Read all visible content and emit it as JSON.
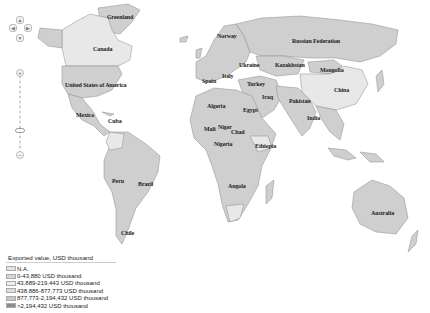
{
  "map": {
    "countries": [
      {
        "name": "Greenland",
        "x": 107,
        "y": 17
      },
      {
        "name": "Canada",
        "x": 95,
        "y": 46
      },
      {
        "name": "United States of America",
        "x": 66,
        "y": 83
      },
      {
        "name": "Mexico",
        "x": 76,
        "y": 115
      },
      {
        "name": "Cuba",
        "x": 108,
        "y": 118
      },
      {
        "name": "Peru",
        "x": 112,
        "y": 180
      },
      {
        "name": "Brazil",
        "x": 138,
        "y": 182
      },
      {
        "name": "Chile",
        "x": 121,
        "y": 230
      },
      {
        "name": "Norway",
        "x": 218,
        "y": 35
      },
      {
        "name": "Russian Federation",
        "x": 292,
        "y": 40
      },
      {
        "name": "Ukraine",
        "x": 239,
        "y": 62
      },
      {
        "name": "Kazakhstan",
        "x": 275,
        "y": 63
      },
      {
        "name": "Mongolia",
        "x": 320,
        "y": 68
      },
      {
        "name": "Italy",
        "x": 222,
        "y": 73
      },
      {
        "name": "Spain",
        "x": 202,
        "y": 79
      },
      {
        "name": "Turkey",
        "x": 247,
        "y": 82
      },
      {
        "name": "Iraq",
        "x": 262,
        "y": 96
      },
      {
        "name": "China",
        "x": 335,
        "y": 87
      },
      {
        "name": "Pakistan",
        "x": 290,
        "y": 99
      },
      {
        "name": "Algeria",
        "x": 208,
        "y": 105
      },
      {
        "name": "Egypt",
        "x": 243,
        "y": 108
      },
      {
        "name": "India",
        "x": 308,
        "y": 116
      },
      {
        "name": "Mali",
        "x": 204,
        "y": 126
      },
      {
        "name": "Niger",
        "x": 219,
        "y": 125
      },
      {
        "name": "Chad",
        "x": 231,
        "y": 129
      },
      {
        "name": "Nigeria",
        "x": 215,
        "y": 140
      },
      {
        "name": "Ethiopia",
        "x": 256,
        "y": 143
      },
      {
        "name": "Angola",
        "x": 228,
        "y": 184
      },
      {
        "name": "Australia",
        "x": 372,
        "y": 211
      }
    ]
  },
  "controls": {
    "pan_up": "▲",
    "pan_left": "◀",
    "pan_right": "▶",
    "pan_down": "▼",
    "zoom_in": "+",
    "zoom_out": "−"
  },
  "legend": {
    "title": "Exported value, USD thousand",
    "items": [
      {
        "label": "N.A.",
        "color": "#e2e2e2"
      },
      {
        "label": "0-43,880 USD thousand",
        "color": "#d6d6d6"
      },
      {
        "label": "43,889-219,443 USD thousand",
        "color": "#ececec"
      },
      {
        "label": "438,886-877,773 USD thousand",
        "color": "#dcdcdc"
      },
      {
        "label": "877,773-2,194,432 USD thousand",
        "color": "#c6c6c6"
      },
      {
        "label": ">2,194,432 USD thousand",
        "color": "#8e8e8e"
      }
    ]
  },
  "colors": {
    "land": "#cfcfcf",
    "land_light": "#e6e6e6",
    "border": "#8a8a8a",
    "ocean": "#ffffff"
  }
}
